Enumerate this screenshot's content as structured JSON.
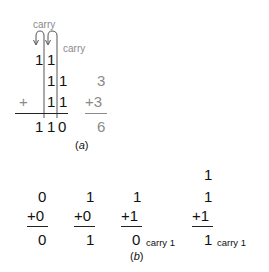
{
  "figure_a": {
    "carry_label_1": "carry",
    "carry_label_2": "carry",
    "carry_row": [
      "1",
      "1"
    ],
    "addend_1": [
      "1",
      "1"
    ],
    "plus_sign": "+",
    "addend_2": [
      "1",
      "1"
    ],
    "sum": [
      "1",
      "1",
      "0"
    ],
    "decimal": {
      "addend_1": "3",
      "addend_2": "+3",
      "sum": "6"
    },
    "caption_open": "(",
    "caption_letter": "a",
    "caption_close": ")",
    "colors": {
      "binary": "#111111",
      "decimal": "#8a8a8a",
      "carry_label": "#8a8a8a"
    }
  },
  "figure_b": {
    "cases": [
      {
        "carry_in": "",
        "addend_1": "0",
        "addend_2": "+0",
        "sum": "0",
        "carry_out": ""
      },
      {
        "carry_in": "",
        "addend_1": "1",
        "addend_2": "+0",
        "sum": "1",
        "carry_out": ""
      },
      {
        "carry_in": "",
        "addend_1": "1",
        "addend_2": "+1",
        "sum": "0",
        "carry_out": "carry 1"
      },
      {
        "carry_in": "1",
        "addend_1": "1",
        "addend_2": "+1",
        "sum": "1",
        "carry_out": "carry 1"
      }
    ],
    "caption_open": "(",
    "caption_letter": "b",
    "caption_close": ")"
  }
}
